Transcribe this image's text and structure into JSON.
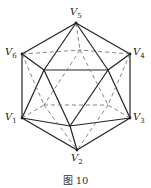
{
  "figure": {
    "caption": "图 10",
    "labels": [
      {
        "id": "V5",
        "text": "V",
        "sub": "5",
        "x": 70,
        "y": 8
      },
      {
        "id": "V6",
        "text": "V",
        "sub": "6",
        "x": 5,
        "y": 48
      },
      {
        "id": "V4",
        "text": "V",
        "sub": "4",
        "x": 133,
        "y": 48
      },
      {
        "id": "V1",
        "text": "V",
        "sub": "1",
        "x": 5,
        "y": 113
      },
      {
        "id": "V3",
        "text": "V",
        "sub": "3",
        "x": 133,
        "y": 113
      },
      {
        "id": "V2",
        "text": "V",
        "sub": "2",
        "x": 71,
        "y": 154
      }
    ],
    "colors": {
      "solid": "#222222",
      "dashed": "#777777"
    }
  }
}
